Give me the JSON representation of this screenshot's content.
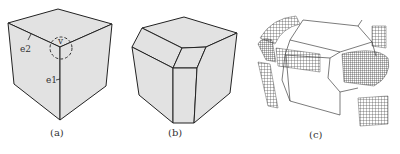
{
  "figure": {
    "panels": [
      {
        "id": "a",
        "caption": "(a)",
        "description": "cube with labeled edges and vertex",
        "annotations": {
          "edge1": "e1",
          "edge2": "e2",
          "vertex": "v"
        }
      },
      {
        "id": "b",
        "caption": "(b)",
        "description": "cube with beveled vertex and edges"
      },
      {
        "id": "c",
        "caption": "(c)",
        "description": "wireframe beveled cube with mesh patches at corners"
      }
    ],
    "colors": {
      "face": "#e2e2e2",
      "edge": "#222222",
      "mesh": "#333333"
    }
  }
}
